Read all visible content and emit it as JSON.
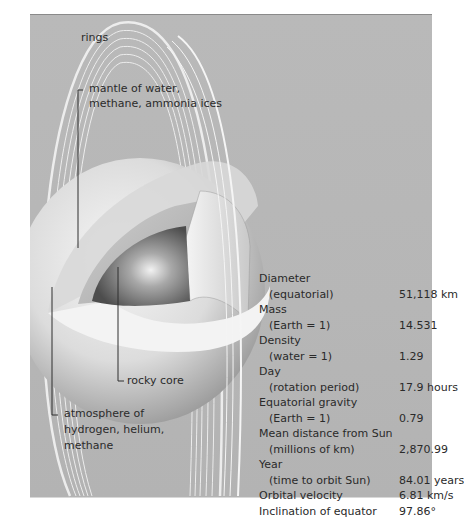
{
  "diagram": {
    "labels": {
      "rings": "rings",
      "mantle_line1": "mantle of water,",
      "mantle_line2": "methane, ammonia ices",
      "core": "rocky core",
      "atmosphere_line1": "atmosphere of",
      "atmosphere_line2": "hydrogen, helium,",
      "atmosphere_line3": "methane"
    },
    "colors": {
      "background": "#b8b8b8",
      "text": "#2b2b2b",
      "ring": "#f4f4f4",
      "core": "#7a7a7a"
    }
  },
  "stats": {
    "rows": [
      {
        "label": "Diameter",
        "sub": "(equatorial)",
        "value": "51,118 km"
      },
      {
        "label": "Mass",
        "sub": "(Earth = 1)",
        "value": "14.531"
      },
      {
        "label": "Density",
        "sub": "(water = 1)",
        "value": "1.29"
      },
      {
        "label": "Day",
        "sub": "(rotation period)",
        "value": "17.9 hours"
      },
      {
        "label": "Equatorial gravity",
        "sub": "(Earth = 1)",
        "value": "0.79"
      },
      {
        "label": "Mean distance from Sun",
        "sub": "(millions of km)",
        "value": "2,870.99"
      },
      {
        "label": "Year",
        "sub": "(time to orbit Sun)",
        "value": "84.01 years"
      },
      {
        "label": "Orbital velocity",
        "sub": null,
        "value": "6.81 km/s"
      },
      {
        "label": "Inclination of equator",
        "sub": null,
        "value": "97.86°"
      }
    ]
  }
}
